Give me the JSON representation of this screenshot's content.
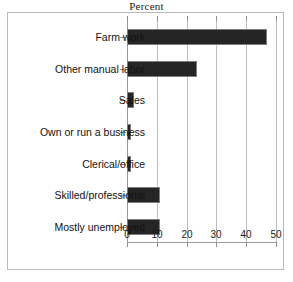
{
  "chart_data": {
    "type": "bar",
    "orientation": "horizontal",
    "title": "Percent",
    "xlabel": "",
    "ylabel": "",
    "xlim": [
      0,
      50
    ],
    "xticks": [
      0,
      10,
      20,
      30,
      40,
      50
    ],
    "grid": true,
    "legend": false,
    "bar_color": "#252525",
    "categories": [
      "Farm work",
      "Other manual labor",
      "Sales",
      "Own or run a business",
      "Clerical/office",
      "Skilled/professional",
      "Mostly unemployed"
    ],
    "values": [
      47,
      23.5,
      2.5,
      1.5,
      1.5,
      11,
      11
    ]
  }
}
